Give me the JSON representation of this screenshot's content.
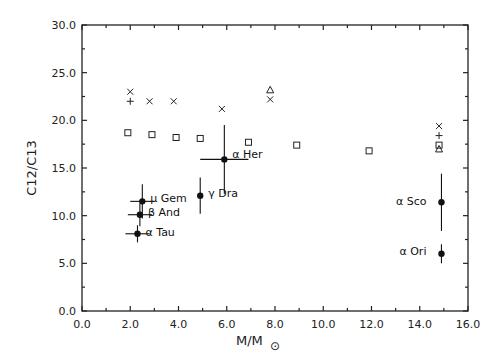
{
  "chart_data": {
    "type": "scatter",
    "title": "",
    "xlabel": "M/M⊙",
    "ylabel": "C12/C13",
    "xlim": [
      0.0,
      16.0
    ],
    "ylim": [
      0.0,
      30.0
    ],
    "xticks": [
      "0.0",
      "2.0",
      "4.0",
      "6.0",
      "8.0",
      "10.0",
      "12.0",
      "14.0",
      "16.0"
    ],
    "yticks": [
      "0.0",
      "5.0",
      "10.0",
      "15.0",
      "20.0",
      "25.0",
      "30.0"
    ],
    "grid": false,
    "legend": null,
    "series": [
      {
        "name": "model-x",
        "marker": "x",
        "points": [
          [
            2.0,
            23.0
          ],
          [
            2.8,
            22.0
          ],
          [
            3.8,
            22.0
          ],
          [
            5.8,
            21.2
          ],
          [
            7.8,
            22.2
          ],
          [
            14.8,
            19.4
          ]
        ]
      },
      {
        "name": "model-plus",
        "marker": "+",
        "points": [
          [
            2.0,
            22.0
          ],
          [
            14.8,
            18.4
          ]
        ]
      },
      {
        "name": "model-square",
        "marker": "square",
        "points": [
          [
            1.9,
            18.7
          ],
          [
            2.9,
            18.5
          ],
          [
            3.9,
            18.2
          ],
          [
            4.9,
            18.1
          ],
          [
            6.9,
            17.7
          ],
          [
            8.9,
            17.4
          ],
          [
            11.9,
            16.8
          ],
          [
            14.8,
            17.4
          ]
        ]
      },
      {
        "name": "model-triangle",
        "marker": "triangle",
        "points": [
          [
            7.8,
            23.2
          ],
          [
            14.8,
            17.0
          ]
        ]
      },
      {
        "name": "observed-stars",
        "marker": "filled-circle",
        "points": [
          {
            "label": "α Tau",
            "x": 2.3,
            "y": 8.1,
            "xerr": 0.5,
            "yerr_up": 0.9,
            "yerr_down": 0.9
          },
          {
            "label": "β And",
            "x": 2.4,
            "y": 10.1,
            "xerr": 0.5,
            "yerr_up": 1.2,
            "yerr_down": 1.2
          },
          {
            "label": "μ Gem",
            "x": 2.5,
            "y": 11.5,
            "xerr": 0.5,
            "yerr_up": 1.8,
            "yerr_down": 1.8
          },
          {
            "label": "γ Dra",
            "x": 4.9,
            "y": 12.1,
            "xerr": 0.0,
            "yerr_up": 1.9,
            "yerr_down": 1.9
          },
          {
            "label": "α Her",
            "x": 5.9,
            "y": 15.9,
            "xerr": 1.0,
            "yerr_up": 3.6,
            "yerr_down": 3.6
          },
          {
            "label": "α Sco",
            "x": 14.9,
            "y": 11.4,
            "xerr": 0.0,
            "yerr_up": 3.0,
            "yerr_down": 3.0
          },
          {
            "label": "α Ori",
            "x": 14.9,
            "y": 6.0,
            "xerr": 0.0,
            "yerr_up": 1.0,
            "yerr_down": 1.0
          }
        ]
      }
    ]
  },
  "axes": {
    "x_title_main": "M/M",
    "x_title_sub": "⊙",
    "y_title": "C12/C13"
  }
}
